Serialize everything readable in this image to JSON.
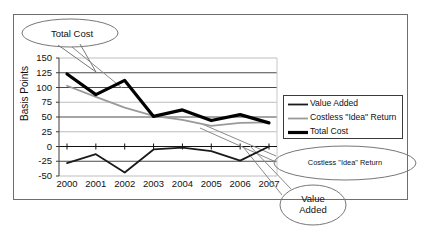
{
  "figure": {
    "border_color": "#6e6e6e",
    "background": "#ffffff"
  },
  "axes": {
    "ylabel": "Basis Points",
    "yticks": [
      "150",
      "125",
      "100",
      "75",
      "50",
      "25",
      "0",
      "-25",
      "-50"
    ],
    "xticks": [
      "2000",
      "2001",
      "2002",
      "2003",
      "2004",
      "2005",
      "2006",
      "2007"
    ]
  },
  "legend": {
    "items": [
      {
        "label": "Value Added",
        "color": "#1a1a1a",
        "width": 1.8
      },
      {
        "label": "Costless \"Idea\" Return",
        "color": "#9a9a9a",
        "width": 1.8
      },
      {
        "label": "Total Cost",
        "color": "#000000",
        "width": 3.2
      }
    ]
  },
  "callouts": [
    {
      "name": "total-cost-callout",
      "text": "Total Cost",
      "lines": [
        "Total Cost"
      ]
    },
    {
      "name": "costless-idea-return-callout",
      "text": "Costless \"Idea\" Return",
      "lines": [
        "Costless \"Idea\" Return"
      ]
    },
    {
      "name": "value-added-callout",
      "text": "Value Added",
      "lines": [
        "Value",
        "Added"
      ]
    }
  ],
  "chart_data": {
    "type": "line",
    "title": "",
    "xlabel": "",
    "ylabel": "Basis Points",
    "categories": [
      "2000",
      "2001",
      "2002",
      "2003",
      "2004",
      "2005",
      "2006",
      "2007"
    ],
    "ylim": [
      -50,
      150
    ],
    "ytick_values": [
      150,
      125,
      100,
      75,
      50,
      25,
      0,
      -25,
      -50
    ],
    "grid": true,
    "legend_position": "right",
    "series": [
      {
        "name": "Total Cost",
        "color": "#000000",
        "width": 3.2,
        "values": [
          123,
          88,
          112,
          51,
          62,
          44,
          54,
          40
        ]
      },
      {
        "name": "Costless \"Idea\" Return",
        "color": "#9a9a9a",
        "width": 1.8,
        "values": [
          103,
          84,
          66,
          52,
          45,
          35,
          40,
          41
        ]
      },
      {
        "name": "Value Added",
        "color": "#1a1a1a",
        "width": 1.8,
        "values": [
          -28,
          -13,
          -44,
          -5,
          -2,
          -8,
          -24,
          0
        ]
      }
    ]
  }
}
